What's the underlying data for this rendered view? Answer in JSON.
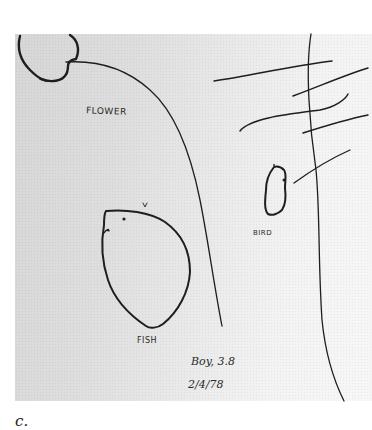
{
  "figure": {
    "caption": "c.",
    "drawing": {
      "labels": {
        "flower": "FLOWER",
        "bird": "BIRD",
        "fish": "FISH"
      },
      "annotations": {
        "age": "Boy, 3.8",
        "date": "2/4/78"
      },
      "colors": {
        "ink": "#1e1e1e",
        "paper_left": "#d6d6d6",
        "paper_right": "#f7f7f7",
        "background": "#ffffff"
      }
    }
  }
}
